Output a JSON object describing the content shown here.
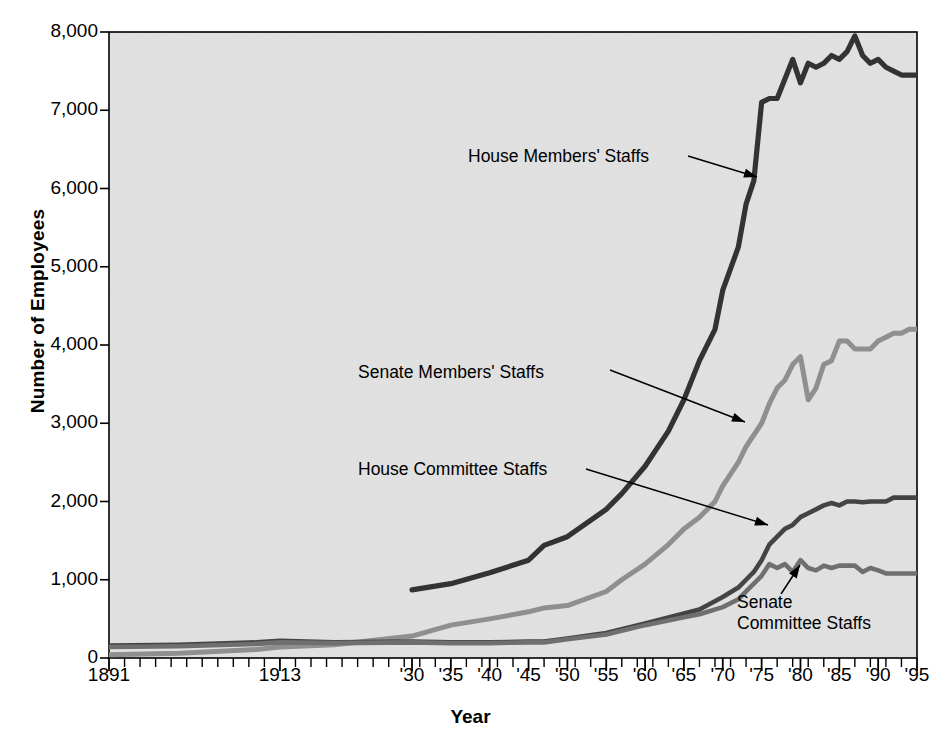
{
  "chart_data": {
    "type": "line",
    "title": "",
    "xlabel": "Year",
    "ylabel": "Number of Employees",
    "xlim": [
      1891,
      1995
    ],
    "ylim": [
      0,
      8000
    ],
    "grid": false,
    "legend_position": "inline-annotations",
    "ytick_labels": [
      "0",
      "1,000",
      "2,000",
      "3,000",
      "4,000",
      "5,000",
      "6,000",
      "7,000",
      "8,000"
    ],
    "ytick_values": [
      0,
      1000,
      2000,
      3000,
      4000,
      5000,
      6000,
      7000,
      8000
    ],
    "xtick_labels": [
      "1891",
      "1913",
      "'30",
      "'35",
      "'40",
      "'45",
      "'50",
      "'55",
      "'60",
      "'65",
      "'70",
      "'75",
      "'80",
      "'85",
      "'90",
      "'95"
    ],
    "xtick_values": [
      1891,
      1913,
      1930,
      1935,
      1940,
      1945,
      1950,
      1955,
      1960,
      1965,
      1970,
      1975,
      1980,
      1985,
      1990,
      1995
    ],
    "minor_tick_interval": 2,
    "annotations": [
      {
        "label": "House Members' Staffs",
        "series": "House Members' Staffs"
      },
      {
        "label": "Senate Members' Staffs",
        "series": "Senate Members' Staffs"
      },
      {
        "label": "House Committee Staffs",
        "series": "House Committee Staffs"
      },
      {
        "label": "Senate",
        "label2": "Committee Staffs",
        "series": "Senate Committee Staffs"
      }
    ],
    "series": [
      {
        "name": "House Members' Staffs",
        "color": "#333333",
        "x": [
          1930,
          1935,
          1940,
          1945,
          1947,
          1950,
          1955,
          1957,
          1960,
          1963,
          1965,
          1967,
          1969,
          1970,
          1972,
          1973,
          1974,
          1975,
          1976,
          1977,
          1978,
          1979,
          1980,
          1981,
          1982,
          1983,
          1984,
          1985,
          1986,
          1987,
          1988,
          1989,
          1990,
          1991,
          1992,
          1993,
          1994,
          1995
        ],
        "values": [
          870,
          950,
          1090,
          1250,
          1440,
          1550,
          1900,
          2100,
          2450,
          2900,
          3300,
          3800,
          4200,
          4700,
          5250,
          5800,
          6100,
          7100,
          7150,
          7150,
          7400,
          7650,
          7350,
          7600,
          7550,
          7600,
          7700,
          7650,
          7750,
          7950,
          7700,
          7600,
          7650,
          7550,
          7500,
          7450,
          7450,
          7450
        ]
      },
      {
        "name": "Senate Members' Staffs",
        "color": "#8f8f8f",
        "x": [
          1891,
          1900,
          1910,
          1913,
          1920,
          1930,
          1935,
          1940,
          1945,
          1947,
          1950,
          1955,
          1957,
          1960,
          1963,
          1965,
          1967,
          1969,
          1970,
          1972,
          1973,
          1975,
          1976,
          1977,
          1978,
          1979,
          1980,
          1981,
          1982,
          1983,
          1984,
          1985,
          1986,
          1987,
          1988,
          1989,
          1990,
          1991,
          1992,
          1993,
          1994,
          1995
        ],
        "values": [
          40,
          60,
          110,
          140,
          170,
          280,
          420,
          500,
          590,
          640,
          670,
          850,
          1000,
          1200,
          1450,
          1650,
          1800,
          2000,
          2200,
          2500,
          2700,
          3000,
          3250,
          3450,
          3550,
          3750,
          3850,
          3300,
          3450,
          3750,
          3800,
          4050,
          4050,
          3950,
          3950,
          3950,
          4050,
          4100,
          4150,
          4150,
          4200,
          4200
        ]
      },
      {
        "name": "House Committee Staffs",
        "color": "#444444",
        "x": [
          1891,
          1900,
          1910,
          1913,
          1920,
          1930,
          1935,
          1940,
          1945,
          1947,
          1950,
          1955,
          1960,
          1965,
          1967,
          1970,
          1972,
          1973,
          1974,
          1975,
          1976,
          1977,
          1978,
          1979,
          1980,
          1981,
          1982,
          1983,
          1984,
          1985,
          1986,
          1987,
          1988,
          1989,
          1990,
          1991,
          1992,
          1993,
          1994,
          1995
        ],
        "values": [
          160,
          170,
          200,
          220,
          200,
          210,
          200,
          200,
          210,
          210,
          250,
          320,
          440,
          570,
          620,
          780,
          900,
          1000,
          1100,
          1250,
          1450,
          1550,
          1650,
          1700,
          1800,
          1850,
          1900,
          1950,
          1980,
          1950,
          2000,
          2000,
          1990,
          2000,
          2000,
          2000,
          2050,
          2050,
          2050,
          2050
        ]
      },
      {
        "name": "Senate Committee Staffs",
        "color": "#6f6f6f",
        "x": [
          1891,
          1900,
          1910,
          1913,
          1920,
          1930,
          1935,
          1940,
          1945,
          1947,
          1950,
          1955,
          1960,
          1965,
          1967,
          1970,
          1972,
          1973,
          1974,
          1975,
          1976,
          1977,
          1978,
          1979,
          1980,
          1981,
          1982,
          1983,
          1984,
          1985,
          1986,
          1987,
          1988,
          1989,
          1990,
          1991,
          1992,
          1993,
          1994,
          1995
        ],
        "values": [
          140,
          150,
          180,
          200,
          190,
          200,
          190,
          190,
          200,
          200,
          240,
          300,
          420,
          520,
          560,
          650,
          750,
          850,
          950,
          1050,
          1200,
          1150,
          1200,
          1100,
          1250,
          1150,
          1120,
          1180,
          1150,
          1180,
          1180,
          1180,
          1100,
          1150,
          1120,
          1080,
          1080,
          1080,
          1080,
          1080
        ]
      }
    ]
  },
  "plot": {
    "bg_color": "#e2e2e2",
    "border_color": "#000000"
  }
}
